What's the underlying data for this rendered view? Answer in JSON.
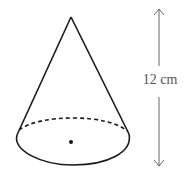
{
  "diagram": {
    "shape": "cone",
    "height_label": "12 cm",
    "colors": {
      "outline": "#1a1a1a",
      "dimension": "#666666",
      "label": "#555555"
    },
    "features": [
      "apex",
      "base-ellipse",
      "hidden-back-edge-dashed",
      "center-dot",
      "height-dimension-arrow"
    ]
  }
}
